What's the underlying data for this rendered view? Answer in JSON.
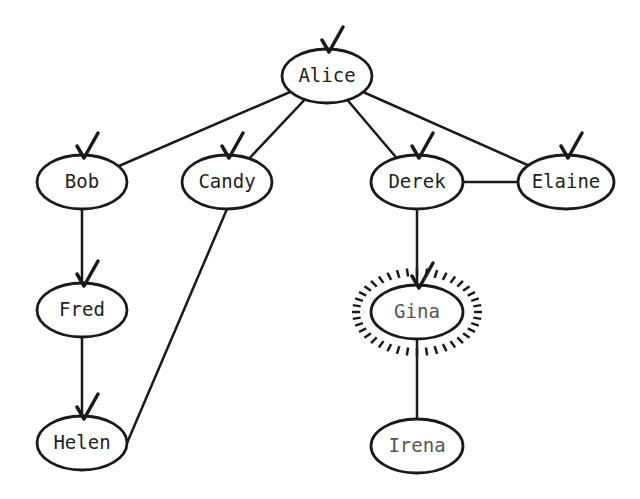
{
  "diagram": {
    "type": "graph-traversal",
    "nodes": [
      {
        "id": "alice",
        "label": "Alice",
        "x": 327,
        "y": 76,
        "rx": 45,
        "ry": 27,
        "visited": true
      },
      {
        "id": "bob",
        "label": "Bob",
        "x": 82,
        "y": 182,
        "rx": 45,
        "ry": 27,
        "visited": true
      },
      {
        "id": "candy",
        "label": "Candy",
        "x": 227,
        "y": 182,
        "rx": 45,
        "ry": 27,
        "visited": true
      },
      {
        "id": "derek",
        "label": "Derek",
        "x": 417,
        "y": 182,
        "rx": 46,
        "ry": 27,
        "visited": true
      },
      {
        "id": "elaine",
        "label": "Elaine",
        "x": 566,
        "y": 182,
        "rx": 48,
        "ry": 27,
        "visited": true
      },
      {
        "id": "fred",
        "label": "Fred",
        "x": 82,
        "y": 310,
        "rx": 45,
        "ry": 27,
        "visited": true
      },
      {
        "id": "gina",
        "label": "Gina",
        "x": 417,
        "y": 312,
        "rx": 46,
        "ry": 27,
        "visited": true,
        "highlighted": true
      },
      {
        "id": "helen",
        "label": "Helen",
        "x": 82,
        "y": 443,
        "rx": 45,
        "ry": 27,
        "visited": true
      },
      {
        "id": "irena",
        "label": "Irena",
        "x": 417,
        "y": 446,
        "rx": 46,
        "ry": 27,
        "visited": false
      }
    ],
    "edges": [
      [
        "alice",
        "bob"
      ],
      [
        "alice",
        "candy"
      ],
      [
        "alice",
        "derek"
      ],
      [
        "alice",
        "elaine"
      ],
      [
        "derek",
        "elaine"
      ],
      [
        "bob",
        "fred"
      ],
      [
        "fred",
        "helen"
      ],
      [
        "candy",
        "helen"
      ],
      [
        "derek",
        "gina"
      ],
      [
        "gina",
        "irena"
      ]
    ],
    "colors": {
      "stroke": "#1a1a1a",
      "text": "#222222",
      "background": "#ffffff"
    }
  }
}
